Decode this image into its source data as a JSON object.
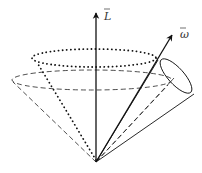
{
  "diagram": {
    "labels": {
      "angular_momentum": "L",
      "angular_velocity": "ω"
    },
    "colors": {
      "stroke": "#111111",
      "label": "#333333",
      "background": "#ffffff"
    }
  }
}
